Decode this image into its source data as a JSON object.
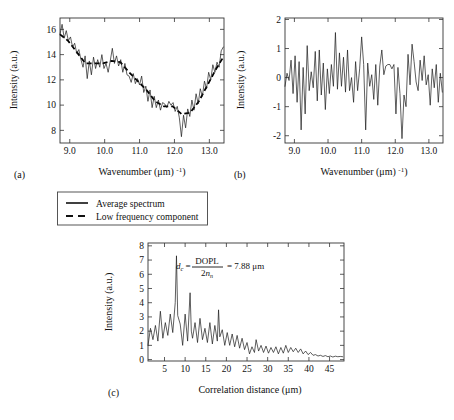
{
  "figure": {
    "panels": [
      {
        "id": "a",
        "label": "(a)"
      },
      {
        "id": "b",
        "label": "(b)"
      },
      {
        "id": "c",
        "label": "(c)"
      }
    ]
  },
  "legend": {
    "position": "below-top-row",
    "items": [
      {
        "label": "Average spectrum",
        "style": "solid"
      },
      {
        "label": "Low frequency component",
        "style": "dashed"
      }
    ]
  },
  "chart_data": [
    {
      "type": "line",
      "panel": "a",
      "title": "",
      "xlabel": "Wavenumber (μm⁻¹)",
      "ylabel": "Intensity (a.u.)",
      "xlim": [
        8.72,
        13.42
      ],
      "ylim": [
        7.0,
        16.9
      ],
      "xticks": [
        9.0,
        10.0,
        11.0,
        12.0,
        13.0
      ],
      "xticklabels": [
        "9.0",
        "10.0",
        "11.0",
        "12.0",
        "13.0"
      ],
      "yticks": [
        8,
        10,
        12,
        14,
        16
      ],
      "yticklabels": [
        "8",
        "10",
        "12",
        "14",
        "16"
      ],
      "grid": false,
      "series": [
        {
          "name": "Average spectrum",
          "style": "solid",
          "x": [
            8.72,
            8.78,
            8.84,
            8.9,
            8.96,
            9.02,
            9.08,
            9.14,
            9.2,
            9.26,
            9.32,
            9.38,
            9.44,
            9.5,
            9.56,
            9.62,
            9.68,
            9.74,
            9.8,
            9.86,
            9.92,
            9.98,
            10.04,
            10.1,
            10.16,
            10.22,
            10.28,
            10.34,
            10.4,
            10.46,
            10.52,
            10.58,
            10.64,
            10.7,
            10.76,
            10.82,
            10.88,
            10.94,
            11.0,
            11.06,
            11.12,
            11.18,
            11.24,
            11.3,
            11.36,
            11.42,
            11.48,
            11.54,
            11.6,
            11.66,
            11.72,
            11.78,
            11.84,
            11.9,
            11.96,
            12.02,
            12.08,
            12.14,
            12.2,
            12.26,
            12.32,
            12.38,
            12.44,
            12.5,
            12.56,
            12.62,
            12.68,
            12.74,
            12.8,
            12.86,
            12.92,
            12.98,
            13.04,
            13.1,
            13.16,
            13.22,
            13.28,
            13.34,
            13.4
          ],
          "y": [
            15.6,
            16.4,
            15.3,
            15.9,
            15.1,
            15.4,
            14.6,
            14.9,
            14.1,
            14.4,
            13.6,
            13.0,
            13.9,
            12.1,
            13.5,
            12.4,
            13.8,
            12.9,
            13.6,
            13.0,
            14.0,
            12.9,
            13.3,
            12.6,
            13.5,
            14.5,
            13.3,
            13.9,
            13.1,
            13.6,
            12.6,
            13.3,
            12.4,
            12.3,
            11.8,
            12.5,
            11.7,
            12.1,
            11.6,
            12.3,
            11.0,
            11.5,
            10.3,
            11.2,
            9.8,
            10.7,
            9.8,
            10.4,
            9.6,
            10.2,
            10.1,
            9.8,
            10.3,
            10.0,
            10.2,
            9.5,
            9.9,
            9.0,
            7.5,
            9.2,
            8.2,
            9.7,
            9.1,
            10.4,
            9.6,
            10.9,
            10.1,
            11.3,
            10.7,
            11.9,
            11.3,
            12.6,
            12.0,
            13.2,
            12.6,
            13.4,
            13.0,
            14.3,
            14.6
          ]
        },
        {
          "name": "Low frequency component",
          "style": "dashed",
          "x": [
            8.72,
            8.95,
            9.2,
            9.45,
            9.7,
            9.95,
            10.2,
            10.45,
            10.7,
            10.95,
            11.2,
            11.45,
            11.7,
            11.95,
            12.2,
            12.45,
            12.7,
            12.95,
            13.2,
            13.4
          ],
          "y": [
            15.6,
            15.1,
            14.2,
            13.3,
            13.3,
            13.3,
            13.5,
            13.4,
            12.6,
            11.9,
            11.2,
            10.3,
            9.9,
            9.9,
            9.3,
            9.4,
            10.3,
            11.6,
            12.9,
            13.8
          ]
        }
      ]
    },
    {
      "type": "line",
      "panel": "b",
      "title": "",
      "xlabel": "Wavenumber (μm⁻¹)",
      "ylabel": "Intensity (a.u.)",
      "xlim": [
        8.72,
        13.42
      ],
      "ylim": [
        -2.25,
        2.05
      ],
      "xticks": [
        9.0,
        10.0,
        11.0,
        12.0,
        13.0
      ],
      "xticklabels": [
        "9.0",
        "10.0",
        "11.0",
        "12.0",
        "13.0"
      ],
      "yticks": [
        -2,
        -1,
        0,
        1,
        2
      ],
      "yticklabels": [
        "-2",
        "-1",
        "0",
        "1",
        "2"
      ],
      "grid": false,
      "series": [
        {
          "name": "High frequency residual",
          "style": "solid",
          "x": [
            8.72,
            8.78,
            8.84,
            8.9,
            8.96,
            9.02,
            9.08,
            9.14,
            9.2,
            9.26,
            9.32,
            9.38,
            9.44,
            9.5,
            9.56,
            9.62,
            9.68,
            9.74,
            9.8,
            9.86,
            9.92,
            9.98,
            10.04,
            10.1,
            10.16,
            10.22,
            10.28,
            10.34,
            10.4,
            10.46,
            10.52,
            10.58,
            10.64,
            10.7,
            10.76,
            10.82,
            10.88,
            10.94,
            11.0,
            11.06,
            11.12,
            11.18,
            11.24,
            11.3,
            11.36,
            11.42,
            11.48,
            11.54,
            11.6,
            11.66,
            11.72,
            11.78,
            11.84,
            11.9,
            11.96,
            12.02,
            12.08,
            12.14,
            12.2,
            12.26,
            12.32,
            12.38,
            12.44,
            12.5,
            12.56,
            12.62,
            12.68,
            12.74,
            12.8,
            12.86,
            12.92,
            12.98,
            13.04,
            13.1,
            13.16,
            13.22,
            13.28,
            13.34,
            13.4
          ],
          "y": [
            -0.3,
            0.15,
            -0.1,
            0.6,
            -0.55,
            0.75,
            -0.85,
            0.55,
            -1.8,
            0.35,
            -1.25,
            1.1,
            -0.45,
            0.2,
            -0.35,
            0.9,
            -0.8,
            0.95,
            -0.6,
            0.5,
            -1.1,
            0.3,
            -0.55,
            0.45,
            -0.3,
            1.55,
            -0.4,
            0.85,
            -0.3,
            0.7,
            -0.5,
            0.95,
            -0.45,
            0.0,
            -0.85,
            0.55,
            -0.45,
            0.3,
            1.4,
            0.45,
            -1.8,
            0.5,
            -0.3,
            0.1,
            -0.75,
            0.45,
            -0.95,
            0.4,
            0.95,
            0.1,
            0.4,
            0.45,
            0.45,
            0.3,
            0.45,
            -1.25,
            0.35,
            -0.55,
            -2.1,
            -0.6,
            -1.0,
            0.8,
            -0.25,
            1.15,
            0.55,
            -0.15,
            -0.45,
            0.6,
            -0.1,
            0.75,
            -0.25,
            0.1,
            -0.95,
            0.3,
            -0.35,
            0.45,
            -0.85,
            0.15,
            -0.5
          ]
        }
      ]
    },
    {
      "type": "line",
      "panel": "c",
      "title": "",
      "xlabel": "Correlation distance (μm)",
      "ylabel": "Intensity (a.u.)",
      "xlim": [
        1.0,
        48.5
      ],
      "ylim": [
        -0.1,
        8.2
      ],
      "xticks": [
        5,
        10,
        15,
        20,
        25,
        30,
        35,
        40,
        45
      ],
      "xticklabels": [
        "5",
        "10",
        "15",
        "20",
        "25",
        "30",
        "35",
        "40",
        "45"
      ],
      "yticks": [
        0,
        1,
        2,
        3,
        4,
        5,
        6,
        7,
        8
      ],
      "yticklabels": [
        "0",
        "1",
        "2",
        "3",
        "4",
        "5",
        "6",
        "7",
        "8"
      ],
      "grid": false,
      "annotation": {
        "text": "d_c = DOPL / (2 n_n) = 7.88 μm",
        "symbol": "d",
        "symbol_sub": "c",
        "numerator": "DOPL",
        "denominator_prefix": "2",
        "denominator_var": "n",
        "denominator_sub": "n",
        "value": "= 7.88 μm",
        "x": 12.0,
        "y": 6.2
      },
      "peak": {
        "x": 7.9,
        "y": 7.3
      },
      "series": [
        {
          "name": "Autocorrelation",
          "style": "solid",
          "x": [
            1.0,
            1.6,
            2.2,
            2.8,
            3.4,
            4.0,
            4.6,
            5.2,
            5.8,
            6.4,
            7.0,
            7.6,
            7.9,
            8.2,
            8.8,
            9.4,
            10.0,
            10.6,
            11.2,
            11.5,
            11.8,
            12.4,
            13.0,
            13.6,
            14.2,
            14.8,
            15.4,
            16.0,
            16.6,
            17.2,
            17.8,
            18.1,
            18.4,
            19.0,
            19.6,
            20.2,
            20.8,
            21.4,
            22.0,
            22.6,
            23.2,
            23.8,
            24.4,
            25.0,
            25.6,
            26.2,
            26.8,
            27.2,
            27.8,
            28.4,
            29.0,
            29.6,
            30.2,
            30.8,
            31.4,
            32.0,
            32.6,
            33.2,
            33.8,
            34.4,
            35.0,
            35.6,
            36.2,
            36.8,
            37.4,
            38.0,
            38.6,
            39.2,
            39.8,
            40.4,
            41.0,
            41.6,
            42.2,
            42.8,
            43.4,
            44.0,
            44.6,
            45.2,
            45.8,
            46.4,
            47.0,
            47.6,
            48.2
          ],
          "y": [
            1.0,
            2.2,
            1.4,
            2.4,
            1.3,
            3.4,
            1.5,
            2.6,
            1.7,
            3.2,
            1.9,
            4.0,
            7.3,
            3.1,
            2.5,
            1.0,
            3.2,
            1.3,
            4.7,
            2.0,
            1.5,
            2.6,
            1.2,
            2.9,
            1.4,
            2.2,
            1.2,
            2.6,
            1.1,
            2.4,
            1.3,
            3.5,
            1.6,
            2.1,
            1.0,
            1.9,
            1.0,
            1.8,
            0.9,
            1.7,
            0.8,
            1.5,
            0.7,
            1.2,
            0.4,
            0.9,
            0.5,
            1.4,
            0.6,
            1.0,
            0.5,
            0.95,
            0.45,
            0.85,
            0.5,
            0.9,
            0.4,
            0.85,
            0.45,
            1.0,
            0.5,
            0.85,
            0.55,
            0.8,
            0.5,
            0.75,
            0.4,
            0.6,
            0.35,
            0.5,
            0.3,
            0.35,
            0.25,
            0.3,
            0.22,
            0.28,
            0.2,
            0.25,
            0.18,
            0.24,
            0.2,
            0.22,
            0.2
          ]
        }
      ]
    }
  ]
}
